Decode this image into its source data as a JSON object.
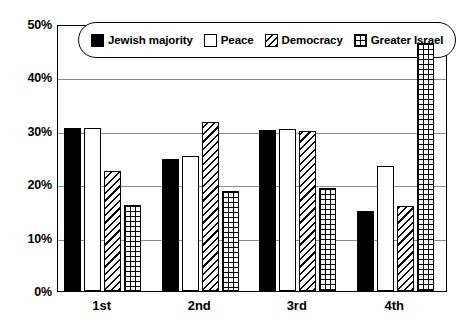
{
  "chart_data": {
    "type": "bar",
    "title": "",
    "subtitle": "",
    "xlabel": "",
    "ylabel": "",
    "categories": [
      "1st",
      "2nd",
      "3rd",
      "4th"
    ],
    "ylim": [
      0,
      50
    ],
    "ytick_values": [
      0,
      10,
      20,
      30,
      40,
      50
    ],
    "ytick_labels": [
      "0%",
      "10%",
      "20%",
      "30%",
      "40%",
      "50%"
    ],
    "grid": true,
    "legend_position": "top-inside",
    "value_suffix": "%",
    "series": [
      {
        "name": "Jewish majority",
        "fill": "solid",
        "color": "#000000",
        "values": [
          30.6,
          24.8,
          30.2,
          14.9
        ]
      },
      {
        "name": "Peace",
        "fill": "empty",
        "color": "#ffffff",
        "values": [
          30.6,
          25.3,
          30.3,
          23.4
        ]
      },
      {
        "name": "Democracy",
        "fill": "diagonal",
        "color": "#ffffff",
        "values": [
          22.4,
          31.7,
          29.9,
          16.0
        ]
      },
      {
        "name": "Greater Israel",
        "fill": "grid",
        "color": "#ffffff",
        "values": [
          16.2,
          18.8,
          19.3,
          46.4
        ]
      }
    ]
  }
}
